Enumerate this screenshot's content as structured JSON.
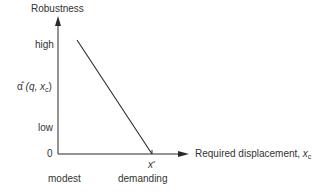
{
  "diagram": {
    "y_axis_title": "Robustness",
    "y_ticks": {
      "high": "high",
      "alpha_hat_symbol": "α̂",
      "alpha_hat_args_open": " (q, ",
      "alpha_hat_var": "x",
      "alpha_hat_sub": "c",
      "alpha_hat_args_close": ")",
      "low": "low",
      "zero": "0"
    },
    "x_axis_title": "Required displacement, ",
    "x_axis_var": "x",
    "x_axis_sub": "c",
    "x_star": "x",
    "x_star_sup": "*",
    "x_scale_labels": {
      "left": "modest",
      "right": "demanding"
    },
    "line": {
      "start": [
        77,
        40
      ],
      "end": [
        152,
        154
      ],
      "color": "#2a2a2a"
    },
    "axis_color": "#2a2a2a"
  }
}
